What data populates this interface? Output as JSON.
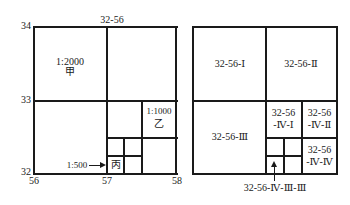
{
  "left_diagram": {
    "top_label": "32-56",
    "y_labels": {
      "top": "34",
      "mid": "33",
      "bottom": "32"
    },
    "x_labels": {
      "left": "56",
      "mid": "57",
      "right": "58"
    },
    "sheet_2000": {
      "scale": "1:2000",
      "name": "甲"
    },
    "sheet_1000": {
      "scale": "1:1000",
      "name": "乙"
    },
    "sheet_500": {
      "scale": "1:500",
      "arrow": "→",
      "name": "丙"
    }
  },
  "right_diagram": {
    "q1": "32-56-Ⅰ",
    "q2": "32-56-Ⅱ",
    "q3": "32-56-Ⅲ",
    "q4_1": {
      "line1": "32-56",
      "line2": "-Ⅳ-Ⅰ"
    },
    "q4_2": {
      "line1": "32-56",
      "line2": "-Ⅳ-Ⅱ"
    },
    "q4_4": {
      "line1": "32-56",
      "line2": "-Ⅳ-Ⅳ"
    },
    "callout": "32-56-Ⅳ-Ⅲ-Ⅲ"
  },
  "colors": {
    "line": "#1a1a1a",
    "background": "#ffffff"
  }
}
